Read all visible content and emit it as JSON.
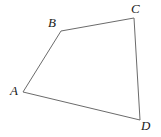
{
  "figure": {
    "type": "geometry-diagram",
    "shape": "quadrilateral",
    "name": "ABCD",
    "background_color": "#ffffff",
    "stroke_color": "#6b6b6b",
    "stroke_width": 1,
    "label_color": "#1a1a1a",
    "label_style": "italic-serif",
    "label_font_size": 13,
    "canvas": {
      "width": 161,
      "height": 137
    },
    "vertices": [
      {
        "id": "A",
        "label": "A",
        "x": 23,
        "y": 92,
        "label_x": 10,
        "label_y": 84
      },
      {
        "id": "B",
        "label": "B",
        "x": 61,
        "y": 31,
        "label_x": 48,
        "label_y": 16
      },
      {
        "id": "C",
        "label": "C",
        "x": 134,
        "y": 18,
        "label_x": 131,
        "label_y": 2
      },
      {
        "id": "D",
        "label": "D",
        "x": 140,
        "y": 120,
        "label_x": 141,
        "label_y": 119
      }
    ],
    "edges": [
      {
        "id": "AB",
        "from": "A",
        "to": "B"
      },
      {
        "id": "BC",
        "from": "B",
        "to": "C"
      },
      {
        "id": "CD",
        "from": "C",
        "to": "D"
      },
      {
        "id": "DA",
        "from": "D",
        "to": "A"
      }
    ],
    "path": "M 23 92 L 61 31 L 134 18 L 140 120 Z"
  }
}
